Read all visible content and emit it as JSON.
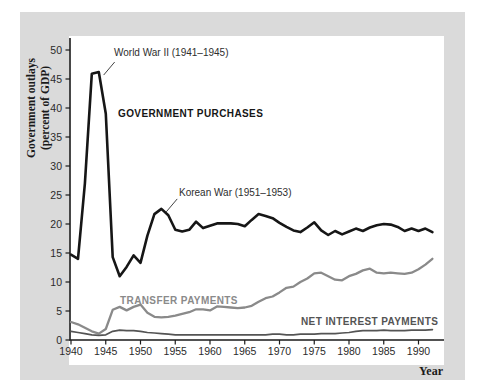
{
  "labels": {
    "y_axis_line1": "Government outlays",
    "y_axis_line2": "(percent of GDP)",
    "x_axis": "Year"
  },
  "colors": {
    "panel_background": "#dadada",
    "plot_background": "#ffffff",
    "axis": "#1a1a1a",
    "tick_text": "#2b2b2b",
    "government_purchases": "#161616",
    "transfer_payments": "#8a8a8a",
    "net_interest": "#545454",
    "leader_line": "#444444"
  },
  "chart_data": {
    "type": "line",
    "title": "",
    "xlabel": "Year",
    "ylabel": "Government outlays (percent of GDP)",
    "xlim": [
      1940,
      1993.5
    ],
    "ylim": [
      0,
      52
    ],
    "grid": false,
    "legend_position": "inline-labels",
    "x_ticks": [
      1940,
      1945,
      1950,
      1955,
      1960,
      1965,
      1970,
      1975,
      1980,
      1985,
      1990
    ],
    "y_ticks": [
      0,
      5,
      10,
      15,
      20,
      25,
      30,
      35,
      40,
      45,
      50
    ],
    "x": [
      1940,
      1941,
      1942,
      1943,
      1944,
      1945,
      1946,
      1947,
      1948,
      1949,
      1950,
      1951,
      1952,
      1953,
      1954,
      1955,
      1956,
      1957,
      1958,
      1959,
      1960,
      1961,
      1962,
      1963,
      1964,
      1965,
      1966,
      1967,
      1968,
      1969,
      1970,
      1971,
      1972,
      1973,
      1974,
      1975,
      1976,
      1977,
      1978,
      1979,
      1980,
      1981,
      1982,
      1983,
      1984,
      1985,
      1986,
      1987,
      1988,
      1989,
      1990,
      1991,
      1992
    ],
    "series": [
      {
        "name": "GOVERNMENT PURCHASES",
        "color": "#161616",
        "width": 2.6,
        "values": [
          14.7,
          14.0,
          27.0,
          45.9,
          46.2,
          39.0,
          14.3,
          11.0,
          12.6,
          14.6,
          13.3,
          18.0,
          21.7,
          22.6,
          21.5,
          19.0,
          18.7,
          19.0,
          20.4,
          19.3,
          19.7,
          20.1,
          20.1,
          20.1,
          20.0,
          19.6,
          20.7,
          21.7,
          21.4,
          21.0,
          20.2,
          19.5,
          18.9,
          18.6,
          19.4,
          20.3,
          18.9,
          18.1,
          18.8,
          18.2,
          18.7,
          19.2,
          18.8,
          19.4,
          19.8,
          20.0,
          19.9,
          19.5,
          18.8,
          19.2,
          18.8,
          19.2,
          18.6
        ]
      },
      {
        "name": "TRANSFER PAYMENTS",
        "color": "#8a8a8a",
        "width": 2.3,
        "values": [
          3.1,
          2.7,
          2.1,
          1.5,
          1.1,
          1.9,
          5.2,
          5.7,
          5.1,
          5.7,
          6.1,
          4.7,
          4.0,
          3.9,
          4.0,
          4.2,
          4.5,
          4.8,
          5.3,
          5.3,
          5.1,
          5.8,
          5.7,
          5.6,
          5.5,
          5.6,
          5.9,
          6.6,
          7.2,
          7.5,
          8.2,
          9.0,
          9.2,
          10.0,
          10.6,
          11.5,
          11.6,
          11.0,
          10.4,
          10.3,
          11.0,
          11.4,
          12.0,
          12.3,
          11.6,
          11.5,
          11.6,
          11.5,
          11.4,
          11.6,
          12.2,
          13.0,
          14.0
        ]
      },
      {
        "name": "NET INTEREST PAYMENTS",
        "color": "#545454",
        "width": 1.7,
        "values": [
          1.5,
          1.3,
          1.1,
          0.9,
          0.8,
          0.9,
          1.5,
          1.7,
          1.6,
          1.6,
          1.5,
          1.3,
          1.2,
          1.1,
          1.0,
          0.9,
          0.9,
          0.9,
          0.9,
          0.9,
          0.9,
          0.9,
          0.9,
          0.9,
          0.9,
          0.9,
          0.9,
          0.9,
          0.9,
          1.0,
          1.0,
          0.9,
          0.9,
          1.0,
          1.0,
          1.0,
          1.1,
          1.1,
          1.1,
          1.2,
          1.3,
          1.5,
          1.6,
          1.6,
          1.6,
          1.7,
          1.6,
          1.6,
          1.6,
          1.7,
          1.7,
          1.7,
          1.8
        ]
      }
    ],
    "annotations": [
      {
        "text": "World War II (1941–1945)",
        "year": 1944,
        "value": 46.2
      },
      {
        "text": "Korean War (1951–1953)",
        "year": 1953,
        "value": 22.6
      }
    ]
  }
}
